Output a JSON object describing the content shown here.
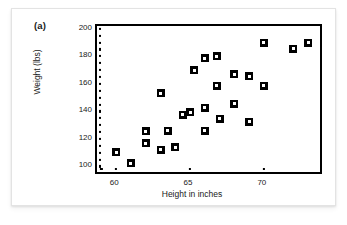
{
  "figure": {
    "panel_label": "(a)"
  },
  "chart_data": {
    "type": "scatter",
    "title": "",
    "xlabel": "Height in inches",
    "ylabel": "Weight (lbs)",
    "xlim": [
      58.7,
      73.8
    ],
    "ylim": [
      96,
      202
    ],
    "xticks": [
      60,
      65,
      70
    ],
    "yticks": [
      100,
      120,
      140,
      160,
      180,
      200
    ],
    "x_minor_ticks": [
      59,
      60,
      65,
      70
    ],
    "y_minor_ticks": [
      100,
      105,
      110,
      115,
      120,
      125,
      130,
      135,
      140,
      145,
      150,
      155,
      160,
      165,
      170,
      175,
      180,
      185,
      190,
      195,
      200
    ],
    "grid": false,
    "legend": null,
    "marker_style": "black-square-with-white-center",
    "points": [
      {
        "x": 60.0,
        "y": 110.5
      },
      {
        "x": 61.0,
        "y": 102.5
      },
      {
        "x": 62.0,
        "y": 125.5
      },
      {
        "x": 62.0,
        "y": 117.0
      },
      {
        "x": 63.0,
        "y": 153.0
      },
      {
        "x": 63.0,
        "y": 112.0
      },
      {
        "x": 63.5,
        "y": 126.0
      },
      {
        "x": 64.0,
        "y": 114.0
      },
      {
        "x": 64.5,
        "y": 137.5
      },
      {
        "x": 65.0,
        "y": 139.5
      },
      {
        "x": 65.3,
        "y": 170.0
      },
      {
        "x": 66.0,
        "y": 178.5
      },
      {
        "x": 66.0,
        "y": 142.5
      },
      {
        "x": 66.0,
        "y": 126.0
      },
      {
        "x": 66.8,
        "y": 180.0
      },
      {
        "x": 66.8,
        "y": 158.5
      },
      {
        "x": 67.0,
        "y": 134.5
      },
      {
        "x": 68.0,
        "y": 167.0
      },
      {
        "x": 68.0,
        "y": 145.5
      },
      {
        "x": 69.0,
        "y": 165.5
      },
      {
        "x": 69.0,
        "y": 132.5
      },
      {
        "x": 70.0,
        "y": 190.0
      },
      {
        "x": 70.0,
        "y": 158.5
      },
      {
        "x": 72.0,
        "y": 185.5
      },
      {
        "x": 73.0,
        "y": 190.0
      }
    ]
  }
}
